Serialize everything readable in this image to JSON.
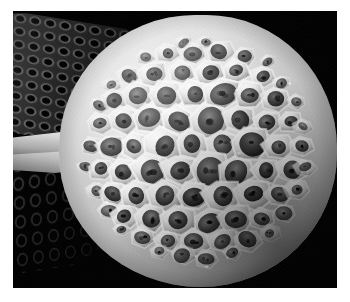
{
  "figure": {
    "kind": "sem-micrograph",
    "title": "",
    "caption": "",
    "canvas": {
      "width": 350,
      "height": 302
    },
    "border": {
      "color": "#ffffff",
      "left": 13,
      "top": 11,
      "right": 13,
      "bottom": 14
    },
    "plate": {
      "x": 13,
      "y": 11,
      "width": 324,
      "height": 277,
      "background_color": "#000000"
    },
    "palette": {
      "background": "#000000",
      "frame": "#ffffff",
      "highlight": "#f6f6f6",
      "midtone": "#9a9a9a",
      "shadow": "#3a3a3a",
      "pore_dark": "#141414"
    },
    "modality": "grayscale",
    "subject": {
      "name": "spherical honeycomb lattice specimen",
      "description": "near-spherical object covered in hexagonal cells, each cell containing a dark recessed pore with finer internal perforations",
      "center": {
        "x": 185,
        "y": 140
      },
      "radius_x": 139,
      "radius_y": 136,
      "cell_count_visible": 86
    },
    "substrate": {
      "name": "perforated plate",
      "description": "flat plate with a regular grid of circular holes, seen obliquely behind and left of the sphere",
      "regions": [
        {
          "name": "upper-left-mesh",
          "x": 0,
          "y": 0,
          "width": 124,
          "height": 122,
          "hole_spacing_x": 15,
          "hole_spacing_y": 13,
          "brightness": "mid-dark"
        },
        {
          "name": "lower-left-mesh",
          "x": 0,
          "y": 150,
          "width": 118,
          "height": 112,
          "hole_spacing_x": 16,
          "hole_spacing_y": 19,
          "brightness": "dark"
        }
      ]
    },
    "strut": {
      "name": "connecting strut",
      "description": "bright tapered ridge bridging from the sphere's left flank toward the plate edge",
      "x": 0,
      "y": 118,
      "width": 110,
      "height": 44
    },
    "annotations": [],
    "scale_bar": null
  },
  "chart_data": {
    "type": "heatmap",
    "title": "",
    "xlabel": "",
    "ylabel": "",
    "grid": false,
    "legend": null,
    "note": "grayscale intensity field of a scanning-electron micrograph; no plotted data series"
  }
}
